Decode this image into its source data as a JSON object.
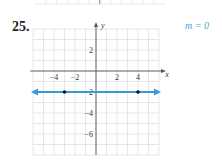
{
  "problem": {
    "number": "25.",
    "slope_label": "m = 0"
  },
  "chart_data": {
    "type": "line",
    "title": "",
    "xlabel": "x",
    "ylabel": "y",
    "xlim": [
      -6,
      6
    ],
    "ylim": [
      -8,
      4
    ],
    "grid": true,
    "x_ticks": [
      -4,
      -2,
      2,
      4
    ],
    "y_ticks": [
      2,
      -2,
      -4,
      -6
    ],
    "series": [
      {
        "name": "y = -2",
        "x": [
          -6,
          6
        ],
        "y": [
          -2,
          -2
        ],
        "color": "#3a9ad9",
        "arrows": "both"
      }
    ],
    "points": [
      {
        "x": -3,
        "y": -2
      },
      {
        "x": 4,
        "y": -2
      }
    ],
    "annotations": [
      "m = 0"
    ]
  }
}
